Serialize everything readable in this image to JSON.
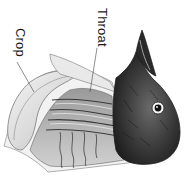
{
  "figure": {
    "orientation": "rotated 90 degrees clockwise",
    "labels": [
      {
        "id": "crop",
        "text": "Crop"
      },
      {
        "id": "throat",
        "text": "Throat"
      }
    ],
    "colors": {
      "background": "#ffffff",
      "head_dark": "#2b2b2b",
      "head_mid": "#555555",
      "tissue_light": "#e6e6e6",
      "tissue_mid": "#a8a8a8",
      "line": "#444444"
    }
  }
}
